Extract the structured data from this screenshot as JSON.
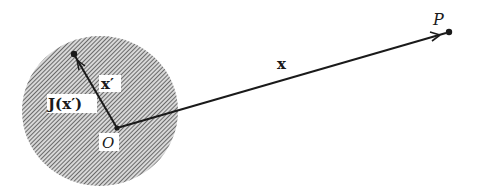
{
  "diagram": {
    "type": "vector diagram",
    "region": {
      "name": "current distribution",
      "fill": "hatched"
    },
    "labels": {
      "origin": "O",
      "field_point": "P",
      "position_vector": "x",
      "source_vector": "x′",
      "current_density": "J(x′)"
    },
    "colors": {
      "ink": "#1a1a1a",
      "background": "#ffffff",
      "hatch": "#444444"
    }
  }
}
